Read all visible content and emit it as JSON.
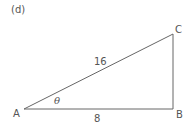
{
  "figure": {
    "part_label": "(d)",
    "triangle": {
      "vertices": {
        "A": "A",
        "B": "B",
        "C": "C"
      },
      "sides": {
        "AC": "16",
        "AB": "8"
      },
      "angle_at_A": "θ",
      "right_angle_at": "B"
    },
    "colors": {
      "stroke": "#555555",
      "background": "#ffffff"
    }
  }
}
